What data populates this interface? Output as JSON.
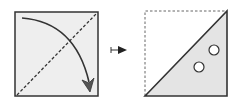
{
  "diagram": {
    "left_panel": {
      "label": "square-with-fold-line-and-arrow",
      "fill": "#eeeeee",
      "stroke": "#333333"
    },
    "maps_to_symbol": "↦",
    "right_panel": {
      "label": "folded-triangle-with-two-holes",
      "fill": "#e4e4e4",
      "stroke": "#333333",
      "hole_count": 2
    }
  }
}
